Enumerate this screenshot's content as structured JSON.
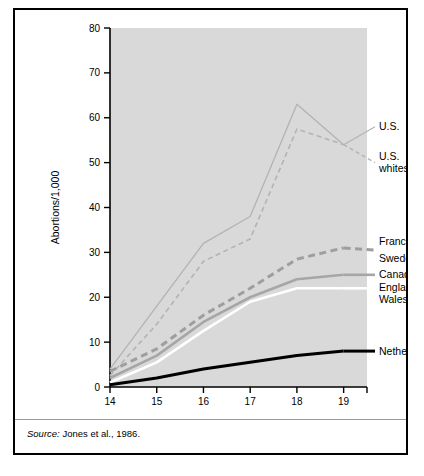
{
  "figure": {
    "source_prefix": "Source:",
    "source_text": " Jones et al., 1986."
  },
  "chart_data": {
    "type": "line",
    "title": "",
    "xlabel": "Age",
    "ylabel": "Abortions/1,000",
    "x": [
      14,
      15,
      16,
      17,
      18,
      19
    ],
    "xtick_labels": [
      "14",
      "15",
      "16",
      "17",
      "18",
      "19"
    ],
    "ytick_labels": [
      "0",
      "10",
      "20",
      "30",
      "40",
      "50",
      "60",
      "70",
      "80"
    ],
    "yticks": [
      0,
      10,
      20,
      30,
      40,
      50,
      60,
      70,
      80
    ],
    "xlim": [
      14,
      19
    ],
    "ylim": [
      0,
      80
    ],
    "grid": false,
    "legend_position": "right-inline",
    "plot_background": "#d9d9d9",
    "series": [
      {
        "name": "U.S.",
        "label": "U.S.",
        "values": [
          4,
          18,
          32,
          38,
          63,
          54
        ],
        "color": "#b3b3b3",
        "style": "solid",
        "width": 1.3,
        "label_y": 58
      },
      {
        "name": "U.S. whites",
        "label": "U.S.\nwhites",
        "label_line1": "U.S.",
        "label_line2": "whites",
        "values": [
          2.5,
          14,
          28,
          33,
          57.5,
          54
        ],
        "color": "#b3b3b3",
        "style": "dashed",
        "width": 1.6,
        "label_y": 50
      },
      {
        "name": "France",
        "label": "France",
        "values": [
          3.5,
          8.5,
          16,
          22,
          28.5,
          31
        ],
        "color": "#9e9e9e",
        "style": "dashed-thick",
        "width": 3,
        "label_y": 32
      },
      {
        "name": "Sweden",
        "label": "Sweden",
        "values": [
          3.5,
          8.5,
          16,
          22,
          28.5,
          31
        ],
        "color": "#9e9e9e",
        "style": "dashed-thick",
        "width": 3,
        "label_y": 29
      },
      {
        "name": "Canada",
        "label": "Canada",
        "values": [
          2,
          7,
          14.5,
          20,
          24,
          25
        ],
        "color": "#a6a6a6",
        "style": "solid",
        "width": 2.6,
        "label_y": 25
      },
      {
        "name": "England & Wales",
        "label": "England &\nWales",
        "label_line1": "England &",
        "label_line2": "Wales",
        "values": [
          1,
          5.5,
          12.5,
          19,
          22,
          22
        ],
        "color": "#ffffff",
        "style": "solid",
        "width": 2.6,
        "label_y": 21
      },
      {
        "name": "Netherlands",
        "label": "Netherlands",
        "values": [
          0.5,
          2,
          4,
          5.5,
          7,
          8
        ],
        "color": "#000000",
        "style": "solid",
        "width": 3,
        "label_y": 8
      }
    ]
  }
}
